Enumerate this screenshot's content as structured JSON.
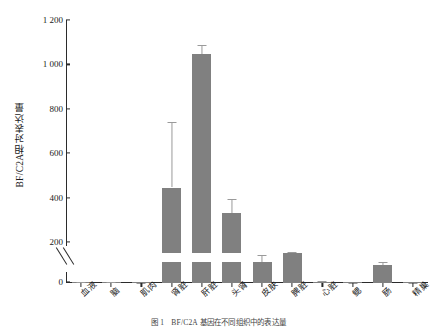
{
  "chart_data": {
    "type": "bar",
    "title": "",
    "xlabel": "",
    "ylabel": "BF/C2A相对表达量",
    "ylim": [
      0,
      1200
    ],
    "yticks": [
      "0",
      "200",
      "400",
      "600",
      "800",
      "1 000",
      "1 200"
    ],
    "ytick_values": [
      0,
      200,
      400,
      600,
      800,
      1000,
      1200
    ],
    "broken_axis": true,
    "break_range": [
      20,
      195
    ],
    "grid": false,
    "legend": "none",
    "bar_color": "#808080",
    "error_color": "#9a9a9a",
    "categories": [
      "血液",
      "脑",
      "肌肉",
      "肾脏",
      "肝脏",
      "头肾",
      "皮肤",
      "脾脏",
      "心脏",
      "鳃",
      "肠",
      "精巢"
    ],
    "values": [
      2,
      3,
      0.5,
      450,
      1050,
      335,
      105,
      150,
      5,
      0.5,
      90,
      0.5
    ],
    "errors": [
      1,
      2,
      0.5,
      295,
      42,
      65,
      35,
      3,
      3,
      0.5,
      15,
      0.5
    ],
    "series": [
      {
        "name": "BF/C2A相对表达量",
        "values": [
          2,
          3,
          0.5,
          450,
          1050,
          335,
          105,
          150,
          5,
          0.5,
          90,
          0.5
        ]
      }
    ]
  },
  "caption": {
    "text": "图 1　BF/C2A 基因在不同组织中的表达量"
  }
}
